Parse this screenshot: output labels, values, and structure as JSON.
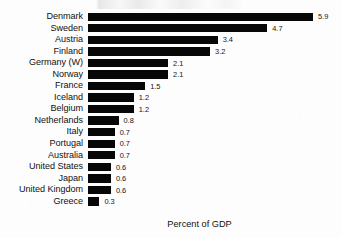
{
  "chart_data": {
    "type": "bar",
    "orientation": "horizontal",
    "title": "",
    "subtitle": "",
    "xlabel": "Percent of GDP",
    "ylabel": "",
    "grid": false,
    "legend": false,
    "xlim": [
      0,
      5.9
    ],
    "value_label_format": "one-decimal",
    "categories": [
      "Denmark",
      "Sweden",
      "Austria",
      "Finland",
      "Germany (W)",
      "Norway",
      "France",
      "Iceland",
      "Belgium",
      "Netherlands",
      "Italy",
      "Portugal",
      "Australia",
      "United States",
      "Japan",
      "United Kingdom",
      "Greece"
    ],
    "values": [
      5.9,
      4.7,
      3.4,
      3.2,
      2.1,
      2.1,
      1.5,
      1.2,
      1.2,
      0.8,
      0.7,
      0.7,
      0.7,
      0.6,
      0.6,
      0.6,
      0.3
    ],
    "value_labels": [
      "5.9",
      "4.7",
      "3.4",
      "3.2",
      "2.1",
      "2.1",
      "1.5",
      "1.2",
      "1.2",
      "0.8",
      "0.7",
      "0.7",
      "0.7",
      "0.6",
      "0.6",
      "0.6",
      "0.3"
    ],
    "bar_color": "#070707",
    "background_color": "#fdfdfd",
    "text_color": "#111111"
  },
  "axis": {
    "x_title": "Percent of GDP"
  }
}
